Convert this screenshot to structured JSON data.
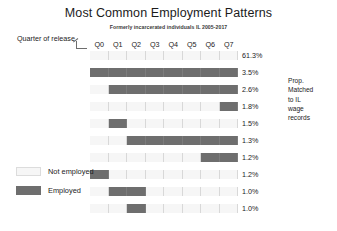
{
  "header": {
    "title": "Most Common Employment Patterns",
    "subtitle": "Formerly incarcerated individuals IL 2005-2017"
  },
  "axis": {
    "note_label": "Quarter of release",
    "quarters": [
      "Q0",
      "Q1",
      "Q2",
      "Q3",
      "Q4",
      "Q5",
      "Q6",
      "Q7"
    ]
  },
  "side_note": {
    "lines": [
      "Prop.",
      "Matched",
      "to IL",
      "wage",
      "records"
    ]
  },
  "legend": {
    "items": [
      {
        "label": "Not employed",
        "state": "not-employed",
        "color": "#f6f6f6"
      },
      {
        "label": "Employed",
        "state": "employed",
        "color": "#6e6e6e"
      }
    ]
  },
  "colors": {
    "employed": "#6e6e6e",
    "not_employed": "#f6f6f6",
    "cell_border": "#d8d8d8",
    "text": "#1b1b1b"
  },
  "chart_data": {
    "type": "heatmap",
    "title": "Most Common Employment Patterns",
    "subtitle": "Formerly incarcerated individuals IL 2005-2017",
    "xlabel": "Quarter of release",
    "ylabel": "Prop. Matched to IL wage records",
    "legend_position": "bottom-left",
    "grid": true,
    "categories": [
      "Q0",
      "Q1",
      "Q2",
      "Q3",
      "Q4",
      "Q5",
      "Q6",
      "Q7"
    ],
    "value_encoding": {
      "0": "Not employed",
      "1": "Employed"
    },
    "rows": [
      {
        "pattern": [
          0,
          0,
          0,
          0,
          0,
          0,
          0,
          0
        ],
        "percent_label": "61.3%",
        "percent": 61.3
      },
      {
        "pattern": [
          1,
          1,
          1,
          1,
          1,
          1,
          1,
          1
        ],
        "percent_label": "3.5%",
        "percent": 3.5
      },
      {
        "pattern": [
          0,
          1,
          1,
          1,
          1,
          1,
          1,
          1
        ],
        "percent_label": "2.6%",
        "percent": 2.6
      },
      {
        "pattern": [
          0,
          0,
          0,
          0,
          0,
          0,
          0,
          1
        ],
        "percent_label": "1.8%",
        "percent": 1.8
      },
      {
        "pattern": [
          0,
          1,
          0,
          0,
          0,
          0,
          0,
          0
        ],
        "percent_label": "1.5%",
        "percent": 1.5
      },
      {
        "pattern": [
          0,
          0,
          1,
          1,
          1,
          1,
          1,
          1
        ],
        "percent_label": "1.3%",
        "percent": 1.3
      },
      {
        "pattern": [
          0,
          0,
          0,
          0,
          0,
          0,
          1,
          1
        ],
        "percent_label": "1.2%",
        "percent": 1.2
      },
      {
        "pattern": [
          1,
          0,
          0,
          0,
          0,
          0,
          0,
          0
        ],
        "percent_label": "1.2%",
        "percent": 1.2
      },
      {
        "pattern": [
          0,
          1,
          1,
          0,
          0,
          0,
          0,
          0
        ],
        "percent_label": "1.0%",
        "percent": 1.0
      },
      {
        "pattern": [
          0,
          0,
          1,
          0,
          0,
          0,
          0,
          0
        ],
        "percent_label": "1.0%",
        "percent": 1.0
      }
    ]
  }
}
